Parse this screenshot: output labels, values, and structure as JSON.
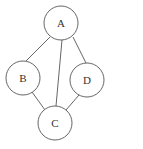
{
  "diagram": {
    "type": "graph",
    "stroke_color": "#555555",
    "node_radius": 17,
    "nodes": [
      {
        "id": "A",
        "label": "A",
        "x": 61,
        "y": 23
      },
      {
        "id": "B",
        "label": "B",
        "x": 23,
        "y": 78
      },
      {
        "id": "D",
        "label": "D",
        "x": 87,
        "y": 80
      },
      {
        "id": "C",
        "label": "C",
        "x": 55,
        "y": 123
      }
    ],
    "edges": [
      {
        "from": "A",
        "to": "B"
      },
      {
        "from": "A",
        "to": "C"
      },
      {
        "from": "A",
        "to": "D"
      },
      {
        "from": "B",
        "to": "C"
      },
      {
        "from": "D",
        "to": "C"
      }
    ]
  }
}
